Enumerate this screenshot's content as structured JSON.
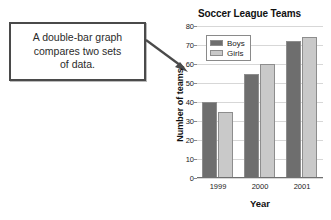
{
  "callout": {
    "text": "A double-bar graph\ncompares two sets\nof data.",
    "arrow_icon": "arrow-down-right-icon"
  },
  "chart_data": {
    "type": "bar",
    "title": "Soccer League Teams",
    "xlabel": "Year",
    "ylabel": "Number of teams",
    "categories": [
      "1999",
      "2000",
      "2001"
    ],
    "series": [
      {
        "name": "Boys",
        "values": [
          40,
          55,
          72
        ],
        "color": "#6e6e6e"
      },
      {
        "name": "Girls",
        "values": [
          35,
          60,
          74
        ],
        "color": "#c9c9c9"
      }
    ],
    "ylim": [
      0,
      80
    ],
    "ytick_step": 10,
    "yticks": [
      "0",
      "10",
      "20",
      "30",
      "40",
      "50",
      "60",
      "70",
      "80"
    ],
    "grid": true,
    "legend_position": "top-left"
  }
}
